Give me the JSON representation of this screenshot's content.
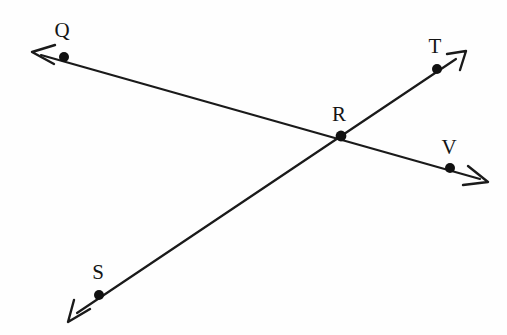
{
  "figure": {
    "background_color": "#fefefe",
    "stroke_color": "#1a1a1a",
    "line_width": 2.2,
    "dot_radius": 5,
    "canvas": {
      "width": 507,
      "height": 335
    }
  },
  "points": [
    {
      "id": "Q",
      "label": "Q",
      "x": 64,
      "y": 57,
      "label_x": 62,
      "label_y": 30
    },
    {
      "id": "T",
      "label": "T",
      "x": 437,
      "y": 69,
      "label_x": 435,
      "label_y": 46
    },
    {
      "id": "R",
      "label": "R",
      "x": 341,
      "y": 136,
      "label_x": 339,
      "label_y": 114
    },
    {
      "id": "V",
      "label": "V",
      "x": 450,
      "y": 168,
      "label_x": 449,
      "label_y": 147
    },
    {
      "id": "S",
      "label": "S",
      "x": 99,
      "y": 295,
      "label_x": 98,
      "label_y": 272
    }
  ],
  "lines": [
    {
      "id": "QV",
      "name": "line-q-r-v",
      "through": [
        "Q",
        "R",
        "V"
      ],
      "start_arrow_tip": {
        "x": 31,
        "y": 52
      },
      "end_arrow_tip": {
        "x": 488,
        "y": 182
      },
      "arrowheads": "both"
    },
    {
      "id": "ST",
      "name": "line-s-r-t",
      "through": [
        "S",
        "R",
        "T"
      ],
      "start_arrow_tip": {
        "x": 68,
        "y": 321
      },
      "end_arrow_tip": {
        "x": 465,
        "y": 52
      },
      "arrowheads": "both"
    }
  ],
  "intersection": {
    "point": "R",
    "x": 341,
    "y": 136
  }
}
